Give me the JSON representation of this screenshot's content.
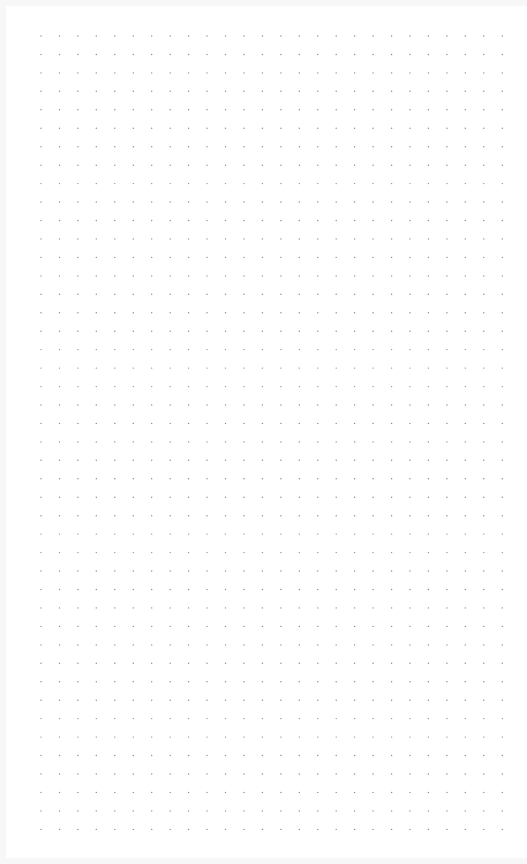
{
  "canvas": {
    "type": "dotted-grid-page",
    "background_color": "#ffffff",
    "outer_color": "#f7f7f7",
    "dot_color": "#8a8a8a",
    "dot_spacing_px": 18.45,
    "origin_x": 41,
    "origin_y": 36,
    "columns": 26,
    "rows": 44,
    "dot_radius": 0.7
  }
}
